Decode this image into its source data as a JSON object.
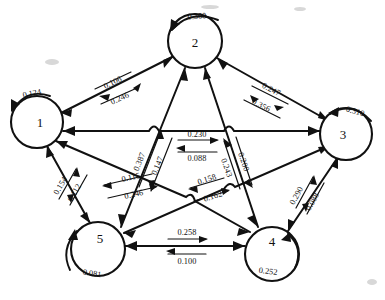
{
  "diagram": {
    "kind": "state-transition-diagram",
    "style": "hand-drawn",
    "node_count": 5,
    "nodes": [
      {
        "id": "1",
        "label": "1",
        "self_loop": "0.124",
        "cx": 37,
        "cy": 122,
        "r": 26
      },
      {
        "id": "2",
        "label": "2",
        "self_loop": "0.300",
        "cx": 195,
        "cy": 41,
        "r": 27
      },
      {
        "id": "3",
        "label": "3",
        "self_loop": "0.310",
        "cx": 346,
        "cy": 134,
        "r": 26
      },
      {
        "id": "4",
        "label": "4",
        "self_loop": "0.252",
        "cx": 272,
        "cy": 254,
        "r": 27
      },
      {
        "id": "5",
        "label": "5",
        "self_loop": "0.081",
        "cx": 98,
        "cy": 249,
        "r": 27
      }
    ],
    "edges": [
      {
        "pair": "1-2",
        "forward": {
          "from": "1",
          "to": "2",
          "value": "0.246"
        },
        "backward": {
          "from": "2",
          "to": "1",
          "value": "0.106"
        }
      },
      {
        "pair": "2-3",
        "forward": {
          "from": "2",
          "to": "3",
          "value": "0.356"
        },
        "backward": {
          "from": "3",
          "to": "2",
          "value": "0.247"
        }
      },
      {
        "pair": "1-3",
        "forward": {
          "from": "1",
          "to": "3",
          "value": "0.230"
        },
        "backward": {
          "from": "3",
          "to": "1",
          "value": "0.088"
        }
      },
      {
        "pair": "2-5",
        "forward": {
          "from": "5",
          "to": "2",
          "value": "0.387"
        },
        "backward": {
          "from": "2",
          "to": "5",
          "value": "0.147"
        }
      },
      {
        "pair": "2-4",
        "forward": {
          "from": "4",
          "to": "2",
          "value": "0.243"
        },
        "backward": {
          "from": "2",
          "to": "4",
          "value": "0.200"
        }
      },
      {
        "pair": "1-4",
        "forward": {
          "from": "4",
          "to": "1",
          "value": "0.115"
        },
        "backward": {
          "from": "1",
          "to": "4",
          "value": "0.246"
        }
      },
      {
        "pair": "3-5",
        "forward": {
          "from": "3",
          "to": "5",
          "value": "0.158"
        },
        "backward": {
          "from": "5",
          "to": "3",
          "value": "0.162"
        }
      },
      {
        "pair": "1-5",
        "forward": {
          "from": "5",
          "to": "1",
          "value": "0.154"
        },
        "backward": {
          "from": "1",
          "to": "5",
          "value": "0.112"
        }
      },
      {
        "pair": "3-4",
        "forward": {
          "from": "4",
          "to": "3",
          "value": "0.290"
        },
        "backward": {
          "from": "3",
          "to": "4",
          "value": "0.088"
        }
      },
      {
        "pair": "4-5",
        "forward": {
          "from": "5",
          "to": "4",
          "value": "0.258"
        },
        "backward": {
          "from": "4",
          "to": "5",
          "value": "0.100"
        }
      }
    ],
    "labels": {
      "node_1": "1",
      "node_2": "2",
      "node_3": "3",
      "node_4": "4",
      "node_5": "5",
      "loop_1": "0.124",
      "loop_2": "0.300",
      "loop_3": "0.310",
      "loop_4": "0.252",
      "loop_5": "0.081",
      "e12_to1": "0.106",
      "e12_to2": "0.246",
      "e23_to2": "0.247",
      "e23_to3": "0.356",
      "e13_to3": "0.230",
      "e13_to1": "0.088",
      "e25_to2": "0.387",
      "e25_to5": "0.147",
      "e24_to2": "0.243",
      "e24_to4": "0.200",
      "e14_to1": "0.115",
      "e14_to4": "0.246",
      "e35_to5": "0.158",
      "e35_to3": "0.162",
      "e15_to1": "0.154",
      "e15_to5": "0.112",
      "e34_to3": "0.290",
      "e34_to4": "0.088",
      "e45_to4": "0.258",
      "e45_to5": "0.100"
    }
  }
}
